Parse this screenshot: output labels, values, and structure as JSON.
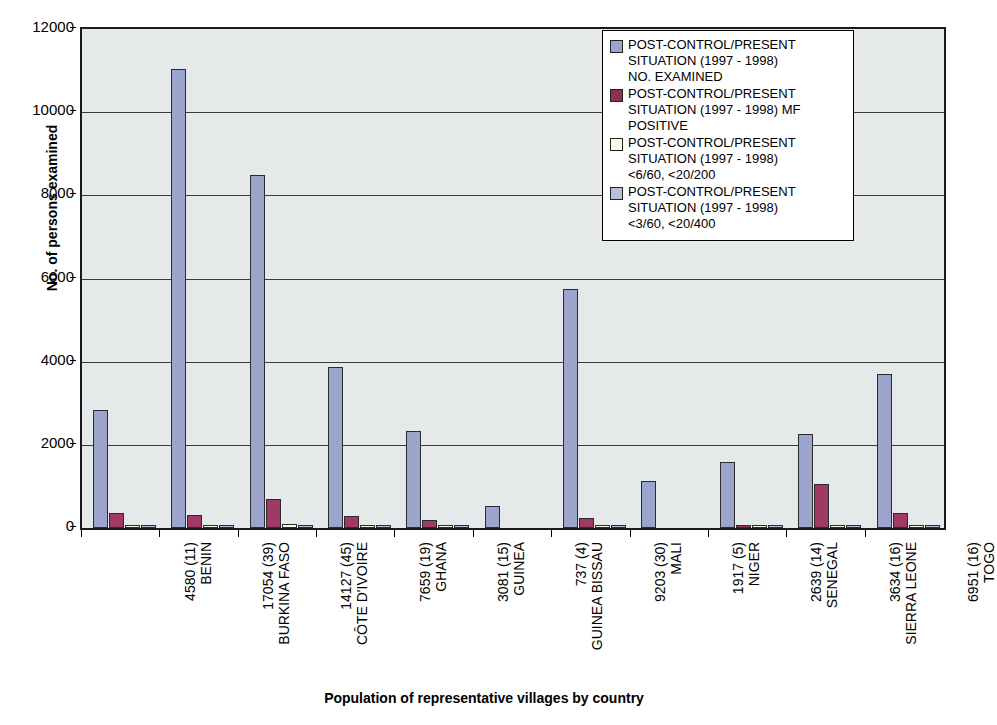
{
  "chart_data": {
    "type": "bar",
    "title": "",
    "xlabel": "Population of representative villages by country",
    "ylabel": "No. of persons examined",
    "ylim": [
      0,
      12000
    ],
    "ytick_labels": [
      "12000",
      "10000",
      "8000",
      "6000",
      "4000",
      "2000",
      "0"
    ],
    "ytick_values": [
      12000,
      10000,
      8000,
      6000,
      4000,
      2000,
      0
    ],
    "grid": true,
    "legend_position": "top-right",
    "categories": [
      "4580 (11) BENIN",
      "17054 (39) BURKINA FASO",
      "14127 (45) CÔTE D'IVOIRE",
      "7659 (19) GHANA",
      "3081 (15) GUINEA",
      "737 (4) GUINEA BISSAU",
      "9203 (30) MALI",
      "1917 (5) NIGER",
      "2639 (14) SENEGAL",
      "3634 (16) SIERRA LEONE",
      "6951 (16) TOGO"
    ],
    "category_parts": [
      {
        "population": "4580 (11)",
        "country": "BENIN"
      },
      {
        "population": "17054 (39)",
        "country": "BURKINA FASO"
      },
      {
        "population": "14127 (45)",
        "country": "CÔTE D'IVOIRE"
      },
      {
        "population": "7659 (19)",
        "country": "GHANA"
      },
      {
        "population": "3081 (15)",
        "country": "GUINEA"
      },
      {
        "population": "737 (4)",
        "country": "GUINEA BISSAU"
      },
      {
        "population": "9203 (30)",
        "country": "MALI"
      },
      {
        "population": "1917 (5)",
        "country": "NIGER"
      },
      {
        "population": "2639 (14)",
        "country": "SENEGAL"
      },
      {
        "population": "3634 (16)",
        "country": "SIERRA LEONE"
      },
      {
        "population": "6951 (16)",
        "country": "TOGO"
      }
    ],
    "series": [
      {
        "name": "POST-CONTROL/PRESENT SITUATION (1997 - 1998) NO. EXAMINED",
        "color": "#9aa4cd",
        "values": [
          2850,
          11050,
          8480,
          3870,
          2340,
          540,
          5750,
          1130,
          1590,
          2250,
          3700
        ]
      },
      {
        "name": "POST-CONTROL/PRESENT SITUATION (1997 - 1998) MF POSITIVE",
        "color": "#8e2f57",
        "values": [
          350,
          320,
          700,
          290,
          190,
          0,
          250,
          0,
          75,
          1070,
          350
        ]
      },
      {
        "name": "POST-CONTROL/PRESENT SITUATION (1997 - 1998) <6/60, <20/200",
        "color": "#fcfce6",
        "values": [
          30,
          40,
          90,
          60,
          40,
          0,
          40,
          0,
          10,
          30,
          25
        ]
      },
      {
        "name": "POST-CONTROL/PRESENT SITUATION (1997 - 1998) <3/60, <20/400",
        "color": "#b9bfd8",
        "values": [
          20,
          25,
          60,
          35,
          25,
          0,
          25,
          0,
          5,
          20,
          15
        ]
      }
    ]
  },
  "legend": {
    "entries": [
      {
        "line1": "POST-CONTROL/PRESENT",
        "line2": "SITUATION (1997 - 1998)",
        "line3": "NO. EXAMINED"
      },
      {
        "line1": "POST-CONTROL/PRESENT",
        "line2": "SITUATION (1997 - 1998) MF",
        "line3": "POSITIVE"
      },
      {
        "line1": "POST-CONTROL/PRESENT",
        "line2": "SITUATION (1997 - 1998)",
        "line3": "<6/60, <20/200"
      },
      {
        "line1": "POST-CONTROL/PRESENT",
        "line2": "SITUATION (1997 - 1998)",
        "line3": "<3/60, <20/400"
      }
    ]
  }
}
